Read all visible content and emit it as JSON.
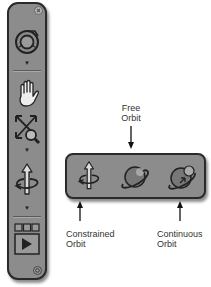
{
  "navbar": {
    "close_icon": "close-icon",
    "tools": [
      {
        "name": "steering-wheel",
        "icon": "steering-wheel-icon",
        "has_dropdown": true
      },
      {
        "name": "pan",
        "icon": "hand-icon"
      },
      {
        "name": "zoom-extents",
        "icon": "zoom-extents-icon"
      },
      {
        "name": "orbit",
        "icon": "constrained-orbit-icon",
        "has_dropdown": true
      },
      {
        "name": "showmotion",
        "icon": "showmotion-icon"
      }
    ],
    "dropdown_glyph": "▼",
    "customize_icon": "options-icon"
  },
  "orbit_flyout": {
    "items": [
      {
        "name": "constrained-orbit",
        "icon": "constrained-orbit-icon"
      },
      {
        "name": "free-orbit",
        "icon": "free-orbit-icon"
      },
      {
        "name": "continuous-orbit",
        "icon": "continuous-orbit-icon"
      }
    ]
  },
  "callouts": {
    "free_orbit": {
      "line1": "Free",
      "line2": "Orbit"
    },
    "constrained_orbit": {
      "line1": "Constrained",
      "line2": "Orbit"
    },
    "continuous_orbit": {
      "line1": "Continuous",
      "line2": "Orbit"
    }
  },
  "colors": {
    "bar_fill": "#8c8c8c",
    "bar_border": "#2a2a2a",
    "label_text": "#333333"
  }
}
